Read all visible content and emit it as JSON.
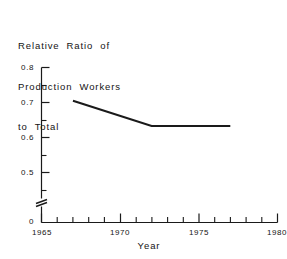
{
  "chart_data": {
    "type": "line",
    "title": "Relative Ratio of Production Workers to Total",
    "title_lines": [
      "Relative  Ratio  of",
      "Production  Workers",
      "to  Total"
    ],
    "xlabel": "Year",
    "ylabel": "",
    "x": [
      1967,
      1972,
      1977
    ],
    "values": [
      0.705,
      0.633,
      0.633
    ],
    "series": [
      {
        "name": "Relative Ratio of Production Workers to Total",
        "x": [
          1967,
          1972,
          1977
        ],
        "values": [
          0.705,
          0.633,
          0.633
        ]
      }
    ],
    "xlim": [
      1965,
      1980
    ],
    "ylim": [
      0.5,
      0.8
    ],
    "y_axis_break": true,
    "y_break_label": "0",
    "xticks": [
      1965,
      1970,
      1975,
      1980
    ],
    "xtick_labels": [
      "1965",
      "1970",
      "1975",
      "1980"
    ],
    "x_minor_tick_step": 1,
    "yticks": [
      0.5,
      0.6,
      0.7,
      0.8
    ],
    "ytick_labels": [
      "0.5",
      "0.6",
      "0.7",
      "0.8"
    ],
    "y_minor_tick_step": 0.05,
    "grid": false,
    "legend": "none",
    "line_color": "#1a1a1a",
    "background_color": "#ffffff"
  },
  "axes": {
    "y_tick_labels": [
      {
        "text": "0.8",
        "value": 0.8
      },
      {
        "text": "0.7",
        "value": 0.7
      },
      {
        "text": "0.6",
        "value": 0.6
      },
      {
        "text": "0.5",
        "value": 0.5
      },
      {
        "text": "0",
        "value": 0.0
      }
    ],
    "x_tick_labels": [
      {
        "text": "1965",
        "value": 1965
      },
      {
        "text": "1970",
        "value": 1970
      },
      {
        "text": "1975",
        "value": 1975
      },
      {
        "text": "1980",
        "value": 1980
      }
    ],
    "x_title": "Year"
  }
}
